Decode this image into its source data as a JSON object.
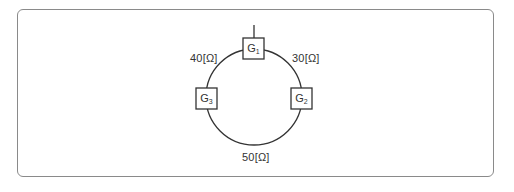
{
  "diagram": {
    "type": "ring network",
    "nodes": [
      {
        "id": "G1",
        "label": "G",
        "sub": "1",
        "position": "top"
      },
      {
        "id": "G2",
        "label": "G",
        "sub": "2",
        "position": "right"
      },
      {
        "id": "G3",
        "label": "G",
        "sub": "3",
        "position": "left"
      }
    ],
    "edges": [
      {
        "from": "G1",
        "to": "G3",
        "label": "40[Ω]"
      },
      {
        "from": "G1",
        "to": "G2",
        "label": "30[Ω]"
      },
      {
        "from": "G2",
        "to": "G3",
        "label": "50[Ω]"
      }
    ],
    "colors": {
      "line": "#333333",
      "frame": "#8a8a8a"
    }
  }
}
